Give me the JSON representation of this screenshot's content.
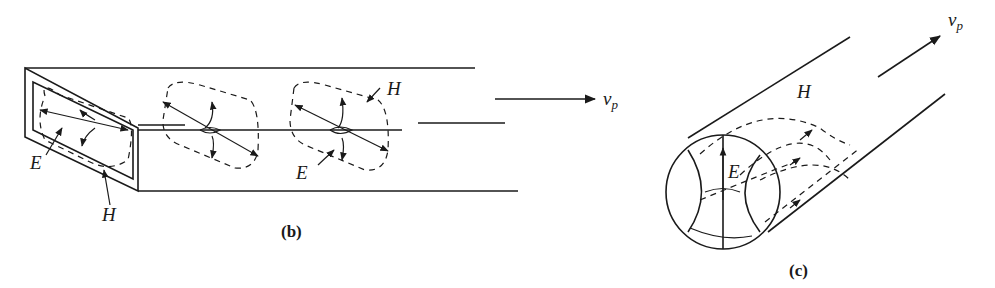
{
  "figure_b": {
    "caption": "(b)",
    "labels": {
      "E_front": "E",
      "H_front": "H",
      "E_mid": "E",
      "H_mid": "H"
    },
    "velocity": {
      "symbol": "v",
      "subscript": "p"
    }
  },
  "figure_c": {
    "caption": "(c)",
    "labels": {
      "E": "E",
      "H": "H"
    },
    "velocity": {
      "symbol": "v",
      "subscript": "p"
    }
  }
}
